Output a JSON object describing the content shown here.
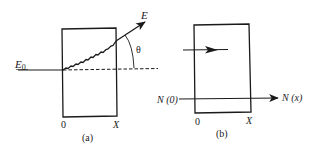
{
  "figure": {
    "panel_a": {
      "caption": "(a)",
      "incident_label": "E",
      "incident_subscript": "0",
      "exit_label": "E",
      "angle_label": "θ",
      "left_boundary_label": "0",
      "right_boundary_label": "X"
    },
    "panel_b": {
      "caption": "(b)",
      "input_label": "N (0)",
      "output_label": "N (x)",
      "left_boundary_label": "0",
      "right_boundary_label": "X"
    },
    "colors": {
      "ink": "#1a1a1a",
      "background": "#ffffff"
    }
  }
}
